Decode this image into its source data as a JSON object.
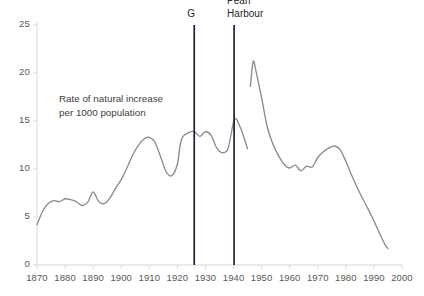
{
  "annotations": {
    "note_line1": "Rate of natural increase",
    "note_line2": "per 1000 population",
    "events": [
      {
        "name": "great-depression-marker",
        "label": "G",
        "year": 1926
      },
      {
        "name": "pearl-harbour-marker",
        "label": "Pearl\nHarbour",
        "year": 1940.2
      }
    ]
  },
  "colors": {
    "line": "#8c8c8c",
    "axis": "#d9d9d9",
    "tick_text": "#595959",
    "event_marker": "#1f1f3d",
    "note_text": "#404040",
    "background": "#ffffff"
  },
  "chart_data": {
    "type": "line",
    "title": "",
    "subtitle": "",
    "xlabel": "",
    "ylabel": "",
    "annotation_text": "Rate of natural increase per 1000 population",
    "grid": false,
    "legend": "none",
    "xlim": [
      1870,
      2000
    ],
    "ylim": [
      0,
      25
    ],
    "xticks": [
      1870,
      1880,
      1890,
      1900,
      1910,
      1920,
      1930,
      1940,
      1950,
      1960,
      1970,
      1980,
      1990,
      2000
    ],
    "yticks": [
      0,
      5,
      10,
      15,
      20,
      25
    ],
    "series": [
      {
        "name": "Rate of natural increase per 1000 population",
        "x": [
          1870,
          1872,
          1874,
          1876,
          1878,
          1880,
          1882,
          1884,
          1886,
          1888,
          1890,
          1892,
          1894,
          1896,
          1898,
          1900,
          1902,
          1904,
          1906,
          1908,
          1910,
          1912,
          1914,
          1916,
          1918,
          1920,
          1921,
          1922,
          1924,
          1926,
          1928,
          1930,
          1932,
          1934,
          1936,
          1938,
          1940,
          1941,
          1942,
          1943,
          1944,
          1945,
          1946,
          1947,
          1948,
          1950,
          1952,
          1954,
          1956,
          1958,
          1960,
          1962,
          1964,
          1966,
          1968,
          1970,
          1972,
          1974,
          1976,
          1978,
          1980,
          1982,
          1984,
          1986,
          1988,
          1990,
          1992,
          1994,
          1995
        ],
        "y": [
          4.2,
          5.6,
          6.4,
          6.7,
          6.6,
          6.9,
          6.8,
          6.6,
          6.2,
          6.5,
          7.6,
          6.6,
          6.4,
          7.0,
          8.0,
          8.9,
          10.1,
          11.4,
          12.4,
          13.1,
          13.3,
          12.8,
          11.3,
          9.7,
          9.3,
          10.5,
          12.5,
          13.4,
          13.8,
          13.9,
          13.4,
          13.9,
          13.5,
          12.2,
          11.7,
          12.1,
          14.9,
          15.2,
          14.6,
          13.9,
          13.0,
          12.1,
          18.6,
          21.2,
          20.2,
          17.4,
          14.4,
          12.6,
          11.4,
          10.5,
          10.1,
          10.4,
          9.8,
          10.3,
          10.2,
          11.2,
          11.8,
          12.2,
          12.4,
          12.0,
          10.8,
          9.4,
          8.1,
          6.9,
          5.8,
          4.6,
          3.3,
          2.1,
          1.7
        ],
        "note": "Pre-1946 segment ends at 1945; 1946 begins the post-war baby boom spike"
      }
    ],
    "markers": [
      {
        "label": "G",
        "year": 1926,
        "ytop": 25.0,
        "ybottom": 0.0
      },
      {
        "label": "Pearl Harbour",
        "year": 1940.2,
        "ytop": 25.0,
        "ybottom": 0.0
      }
    ]
  }
}
